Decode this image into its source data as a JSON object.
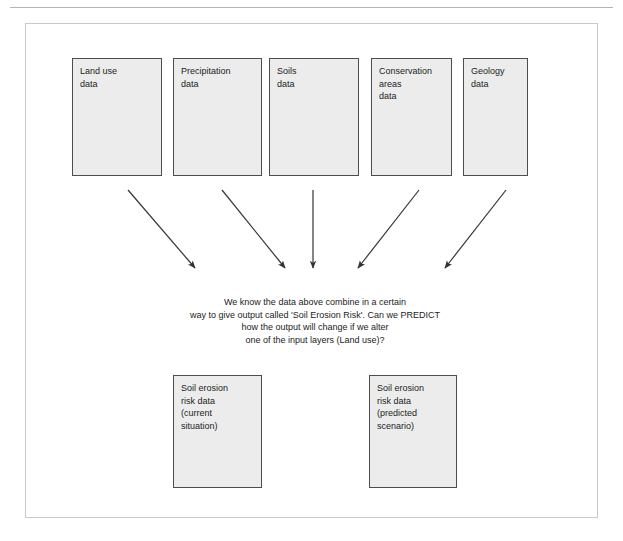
{
  "page": {
    "header_ghost_text": "",
    "background_color": "#ffffff",
    "frame_border_color": "#c9c9c9"
  },
  "diagram": {
    "box_fill_color": "#ececec",
    "box_border_color": "#4d4d4d",
    "arrow_color": "#333333",
    "input_layers": [
      {
        "id": "land-use",
        "label": "Land use\ndata"
      },
      {
        "id": "precipitation",
        "label": "Precipitation\ndata"
      },
      {
        "id": "soils",
        "label": "Soils\ndata"
      },
      {
        "id": "conservation-areas",
        "label": "Conservation\nareas\ndata"
      },
      {
        "id": "geology",
        "label": "Geology\ndata"
      }
    ],
    "statement": "We know the data above combine in a certain\nway to give output called 'Soil Erosion Risk'. Can we PREDICT\nhow the output will change if we alter\none of the input layers (Land use)?",
    "output_layers": [
      {
        "id": "current-situation",
        "label": "Soil erosion\nrisk data\n(current\nsituation)"
      },
      {
        "id": "predicted-scenario",
        "label": "Soil erosion\nrisk data\n(predicted\nscenario)"
      }
    ],
    "arrows": [
      {
        "id": "arrow-land-use",
        "x1": 128,
        "y1": 190,
        "x2": 197,
        "y2": 270
      },
      {
        "id": "arrow-precipitation",
        "x1": 222,
        "y1": 190,
        "x2": 287,
        "y2": 270
      },
      {
        "id": "arrow-soils",
        "x1": 313,
        "y1": 190,
        "x2": 313,
        "y2": 270
      },
      {
        "id": "arrow-conservation-areas",
        "x1": 419,
        "y1": 190,
        "x2": 356,
        "y2": 270
      },
      {
        "id": "arrow-geology",
        "x1": 506,
        "y1": 190,
        "x2": 443,
        "y2": 270
      }
    ]
  }
}
